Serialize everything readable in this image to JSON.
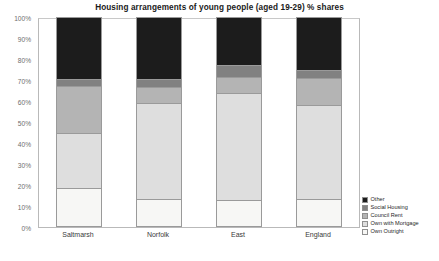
{
  "chart_data": {
    "type": "bar",
    "subtype": "stacked-percent",
    "title": "Housing arrangements of young people (aged 19-29) % shares",
    "xlabel": "",
    "ylabel": "",
    "ylim": [
      0,
      100
    ],
    "ytick_labels": [
      "0%",
      "10%",
      "20%",
      "30%",
      "40%",
      "50%",
      "60%",
      "70%",
      "80%",
      "90%",
      "100%"
    ],
    "ytick_values": [
      0,
      10,
      20,
      30,
      40,
      50,
      60,
      70,
      80,
      90,
      100
    ],
    "grid": false,
    "legend_position": "right-bottom",
    "legend_order": [
      "Other",
      "Social Housing",
      "Council Rent",
      "Own with Mortgage",
      "Own Outright"
    ],
    "categories": [
      "Saltmarsh",
      "Norfolk",
      "East",
      "England"
    ],
    "series": [
      {
        "name": "Own Outright",
        "color": "#f7f7f5",
        "values": [
          18.5,
          13.5,
          13.0,
          13.5
        ]
      },
      {
        "name": "Own with Mortgage",
        "color": "#dedede",
        "values": [
          26.5,
          45.5,
          51.0,
          44.5
        ]
      },
      {
        "name": "Council Rent",
        "color": "#b4b4b4",
        "values": [
          22.0,
          7.5,
          7.5,
          13.0
        ]
      },
      {
        "name": "Social Housing",
        "color": "#818181",
        "values": [
          3.5,
          4.0,
          5.5,
          4.0
        ]
      },
      {
        "name": "Other",
        "color": "#1c1c1c",
        "values": [
          29.5,
          29.5,
          23.0,
          25.0
        ]
      }
    ]
  },
  "legend": {
    "items": [
      {
        "label": "Other",
        "color": "#1c1c1c"
      },
      {
        "label": "Social Housing",
        "color": "#818181"
      },
      {
        "label": "Council Rent",
        "color": "#b4b4b4"
      },
      {
        "label": "Own with Mortgage",
        "color": "#dedede"
      },
      {
        "label": "Own Outright",
        "color": "#f7f7f5"
      }
    ]
  }
}
